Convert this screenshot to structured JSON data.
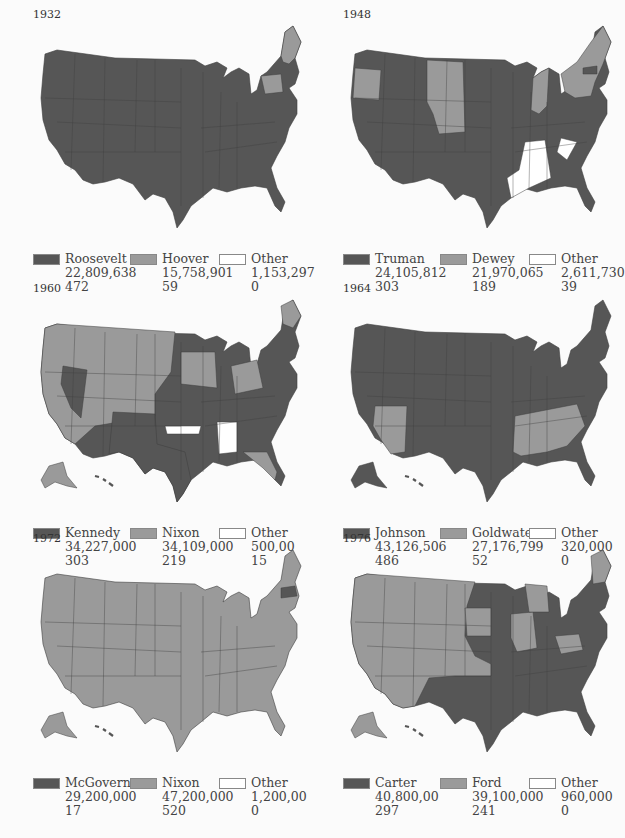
{
  "colors": {
    "winner": "#565656",
    "loser": "#9a9a9a",
    "other": "#ffffff",
    "border": "#3e3e3e",
    "bg": "#fbfbfb"
  },
  "panels": [
    {
      "year": "1932",
      "legend": [
        {
          "name": "Roosevelt",
          "votes": "22,809,638",
          "electoral": "472",
          "swatch": "winner"
        },
        {
          "name": "Hoover",
          "votes": "15,758,901",
          "electoral": "59",
          "swatch": "loser"
        },
        {
          "name": "Other",
          "votes": "1,153,297",
          "electoral": "0",
          "swatch": "other"
        }
      ]
    },
    {
      "year": "1948",
      "legend": [
        {
          "name": "Truman",
          "votes": "24,105,812",
          "electoral": "303",
          "swatch": "winner"
        },
        {
          "name": "Dewey",
          "votes": "21,970,065",
          "electoral": "189",
          "swatch": "loser"
        },
        {
          "name": "Other",
          "votes": "2,611,730",
          "electoral": "39",
          "swatch": "other"
        }
      ]
    },
    {
      "year": "1960",
      "legend": [
        {
          "name": "Kennedy",
          "votes": "34,227,000",
          "electoral": "303",
          "swatch": "winner"
        },
        {
          "name": "Nixon",
          "votes": "34,109,000",
          "electoral": "219",
          "swatch": "loser"
        },
        {
          "name": "Other",
          "votes": "500,00",
          "electoral": "15",
          "swatch": "other"
        }
      ]
    },
    {
      "year": "1964",
      "legend": [
        {
          "name": "Johnson",
          "votes": "43,126,506",
          "electoral": "486",
          "swatch": "winner"
        },
        {
          "name": "Goldwater",
          "votes": "27,176,799",
          "electoral": "52",
          "swatch": "loser"
        },
        {
          "name": "Other",
          "votes": "320,000",
          "electoral": "0",
          "swatch": "other"
        }
      ]
    },
    {
      "year": "1972",
      "legend": [
        {
          "name": "McGovern",
          "votes": "29,200,000",
          "electoral": "17",
          "swatch": "winner"
        },
        {
          "name": "Nixon",
          "votes": "47,200,000",
          "electoral": "520",
          "swatch": "loser"
        },
        {
          "name": "Other",
          "votes": "1,200,00",
          "electoral": "0",
          "swatch": "other"
        }
      ]
    },
    {
      "year": "1976",
      "legend": [
        {
          "name": "Carter",
          "votes": "40,800,00",
          "electoral": "297",
          "swatch": "winner"
        },
        {
          "name": "Ford",
          "votes": "39,100,000",
          "electoral": "241",
          "swatch": "loser"
        },
        {
          "name": "Other",
          "votes": "960,000",
          "electoral": "0",
          "swatch": "other"
        }
      ]
    }
  ]
}
